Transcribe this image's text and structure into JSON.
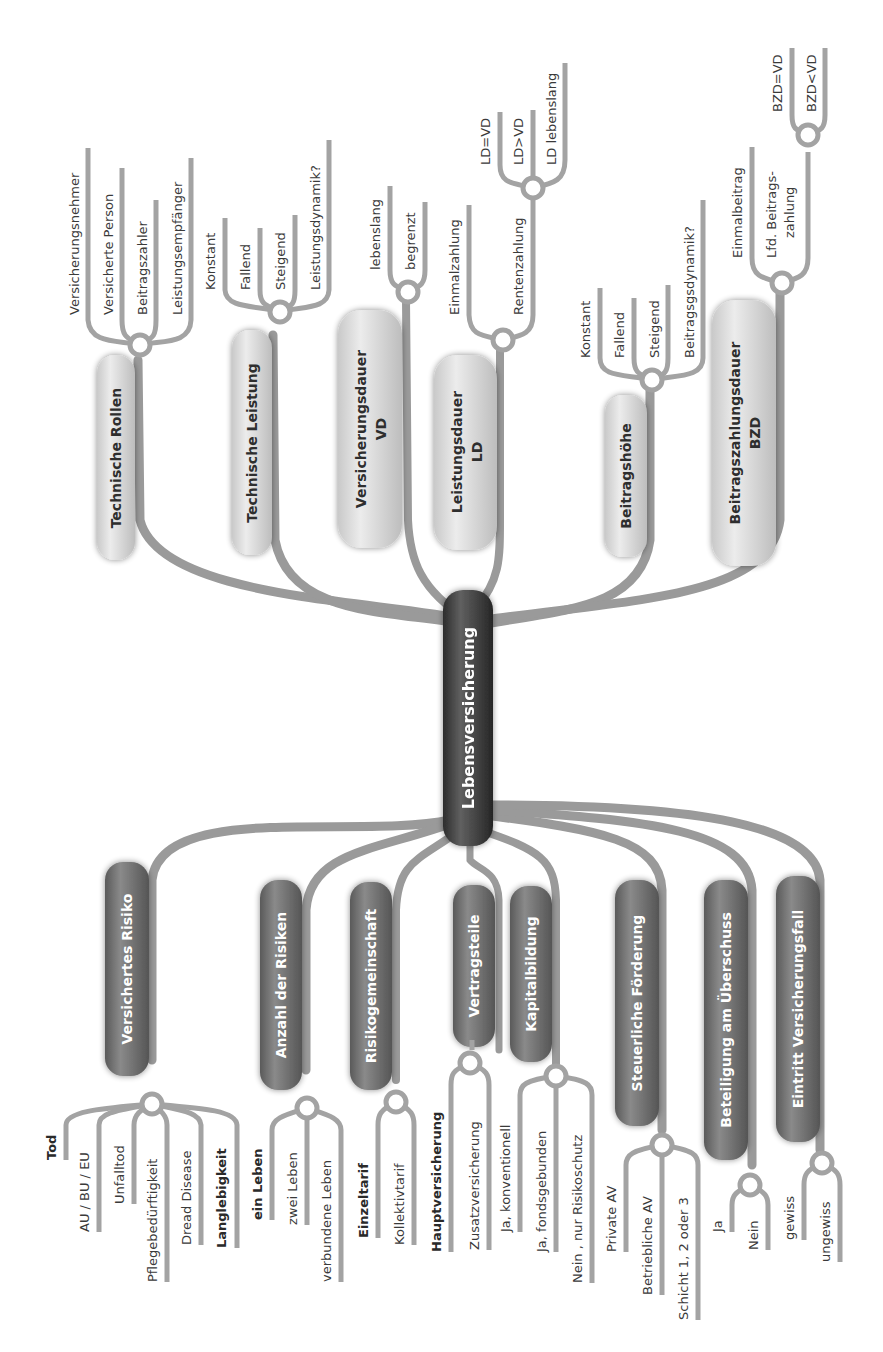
{
  "title": "Lebensversicherung",
  "colors": {
    "center_node": "#3c3c3c",
    "dark_node": "#6e6e6e",
    "light_node": "#d9d9d9",
    "connector": "#9a9a9a",
    "text": "#333333"
  },
  "center": {
    "label": "Lebensversicherung"
  },
  "top_branches": [
    {
      "label": "Technische Rollen",
      "children": [
        "Versicherungsnehmer",
        "Versicherte Person",
        "Beitragszahler",
        "Leistungsempfänger"
      ]
    },
    {
      "label": "Technische Leistung",
      "children": [
        "Konstant",
        "Fallend",
        "Steigend",
        "Leistungsdynamik?"
      ]
    },
    {
      "label_line1": "Versicherungsdauer",
      "label_line2": "VD",
      "children": [
        "lebenslang",
        "begrenzt"
      ]
    },
    {
      "label_line1": "Leistungsdauer",
      "label_line2": "LD",
      "children": [
        "Einmalzahlung",
        "Rentenzahlung"
      ],
      "sub": {
        "parent": "Rentenzahlung",
        "children": [
          "LD=VD",
          "LD>VD",
          "LD lebenslang"
        ]
      }
    },
    {
      "label": "Beitragshöhe",
      "children": [
        "Konstant",
        "Fallend",
        "Steigend",
        "Beitragsgsdynamik?"
      ]
    },
    {
      "label_line1": "Beitragszahlungsdauer",
      "label_line2": "BZD",
      "children": [
        "Einmalbeitrag",
        "Lfd. Beitrags-",
        "zahlung"
      ],
      "child_lfd": {
        "line1": "Lfd. Beitrags-",
        "line2": "zahlung"
      },
      "sub": {
        "parent": "Lfd. Beitragszahlung",
        "children": [
          "BZD=VD",
          "BZD<VD"
        ]
      }
    }
  ],
  "bottom_branches": [
    {
      "label": "Versichertes Risiko",
      "children": [
        {
          "text": "Tod",
          "bold": true
        },
        {
          "text": "AU / BU / EU",
          "bold": false
        },
        {
          "text": "Unfalltod",
          "bold": false
        },
        {
          "text": "Pflegebedürftigkeit",
          "bold": false
        },
        {
          "text": "Dread Disease",
          "bold": false
        },
        {
          "text": "Langlebigkeit",
          "bold": true
        }
      ]
    },
    {
      "label": "Anzahl der Risiken",
      "children": [
        {
          "text": "ein Leben",
          "bold": true
        },
        {
          "text": "zwei Leben",
          "bold": false
        },
        {
          "text": "verbundene Leben",
          "bold": false
        }
      ]
    },
    {
      "label": "Risikogemeinschaft",
      "children": [
        {
          "text": "Einzeltarif",
          "bold": true
        },
        {
          "text": "Kollektivtarif",
          "bold": false
        }
      ]
    },
    {
      "label": "Vertragsteile",
      "children": [
        {
          "text": "Hauptversicherung",
          "bold": true
        },
        {
          "text": "Zusatzversicherung",
          "bold": false
        }
      ]
    },
    {
      "label": "Kapitalbildung",
      "children": [
        {
          "text": "Ja, konventionell",
          "bold": false
        },
        {
          "text": "Ja, fondsgebunden",
          "bold": false
        },
        {
          "text": "Nein , nur Risikoschutz",
          "bold": false
        }
      ]
    },
    {
      "label": "Steuerliche Förderung",
      "children": [
        {
          "text": "Private AV",
          "bold": false
        },
        {
          "text": "Betriebliche AV",
          "bold": false
        },
        {
          "text": "Schicht 1, 2 oder 3",
          "bold": false
        }
      ]
    },
    {
      "label": "Beteiligung am Überschuss",
      "children": [
        {
          "text": "Ja",
          "bold": false
        },
        {
          "text": "Nein",
          "bold": false
        }
      ]
    },
    {
      "label": "Eintritt Versicherungsfall",
      "children": [
        {
          "text": "gewiss",
          "bold": false
        },
        {
          "text": "ungewiss",
          "bold": false
        }
      ]
    }
  ]
}
